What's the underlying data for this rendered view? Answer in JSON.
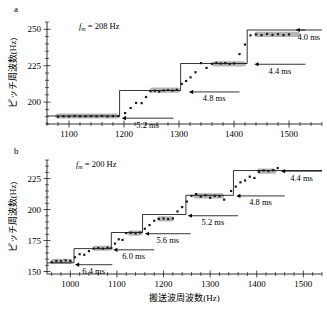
{
  "figure": {
    "panels": [
      {
        "id": "a",
        "label": "a",
        "annotation_text": "= 208 Hz",
        "annotation_symbol": "f",
        "annotation_sub": "m",
        "ylabel": "ピッチ周波数(Hz)",
        "xlabel": "",
        "ytick_labels": [
          "200",
          "225",
          "250"
        ],
        "xtick_labels": [
          "1100",
          "1200",
          "1300",
          "1400",
          "1500"
        ],
        "arrow_labels": [
          "5.2 ms",
          "4.8 ms",
          "4.4 ms",
          "4.0 ms"
        ]
      },
      {
        "id": "b",
        "label": "b",
        "annotation_text": "= 200 Hz",
        "annotation_symbol": "f",
        "annotation_sub": "m",
        "ylabel": "ピッチ周波数(Hz)",
        "xlabel": "搬送波周波数(Hz)",
        "ytick_labels": [
          "150",
          "175",
          "200",
          "225"
        ],
        "xtick_labels": [
          "1000",
          "1100",
          "1200",
          "1300",
          "1400",
          "1500"
        ],
        "arrow_labels": [
          "6.4 ms",
          "6.0 ms",
          "5.6 ms",
          "5.2 ms",
          "4.8 ms",
          "4.4 ms"
        ]
      }
    ]
  },
  "chart_data": [
    {
      "type": "scatter",
      "panel": "a",
      "title": "",
      "xlabel": "",
      "ylabel": "ピッチ周波数(Hz)",
      "xlim": [
        1060,
        1560
      ],
      "ylim": [
        185,
        255
      ],
      "xticks": [
        1100,
        1200,
        1300,
        1400,
        1500
      ],
      "yticks": [
        200,
        225,
        250
      ],
      "grid": false,
      "annotation": "f_m = 208 Hz",
      "step_function": {
        "name": "theoretical pitch (1/period quantization)",
        "x": [
          1060,
          1192,
          1192,
          1303,
          1303,
          1424,
          1424,
          1530
        ],
        "y": [
          190.5,
          190.5,
          208.0,
          208.0,
          226.5,
          226.5,
          249.5,
          249.5
        ]
      },
      "plateau_bands": [
        {
          "x_start": 1075,
          "x_end": 1190,
          "y": 190.5
        },
        {
          "x_start": 1247,
          "x_end": 1302,
          "y": 208.2
        },
        {
          "x_start": 1360,
          "x_end": 1422,
          "y": 226.3
        },
        {
          "x_start": 1437,
          "x_end": 1520,
          "y": 246.5
        }
      ],
      "series": [
        {
          "name": "measured pitch",
          "x": [
            1080,
            1090,
            1100,
            1110,
            1120,
            1130,
            1140,
            1150,
            1160,
            1170,
            1180,
            1190,
            1202,
            1212,
            1222,
            1232,
            1240,
            1248,
            1256,
            1264,
            1272,
            1280,
            1288,
            1296,
            1305,
            1313,
            1321,
            1330,
            1340,
            1350,
            1360,
            1368,
            1376,
            1384,
            1392,
            1400,
            1410,
            1420,
            1430,
            1440,
            1450,
            1460,
            1470,
            1480,
            1490,
            1500
          ],
          "y": [
            190.0,
            190.3,
            190.2,
            190.5,
            190.2,
            190.3,
            190.4,
            190.3,
            190.5,
            190.2,
            190.4,
            190.3,
            192.5,
            196.0,
            199.5,
            199.3,
            203.5,
            207.5,
            207.8,
            207.2,
            208.0,
            208.3,
            208.0,
            208.5,
            212.5,
            214.5,
            217.0,
            220.5,
            226.8,
            223.5,
            226.3,
            227.0,
            226.5,
            226.8,
            226.2,
            226.6,
            233.0,
            239.5,
            245.8,
            246.5,
            246.0,
            246.8,
            246.2,
            246.6,
            246.0,
            246.5
          ]
        }
      ],
      "annotations": [
        {
          "text": "5.2 ms",
          "x_arrow_start": 1290,
          "x_arrow_end": 1196,
          "y": 189.0
        },
        {
          "text": "4.8 ms",
          "x_arrow_start": 1410,
          "x_arrow_end": 1318,
          "y": 207.0
        },
        {
          "text": "4.4 ms",
          "x_arrow_start": 1530,
          "x_arrow_end": 1437,
          "y": 226.0
        },
        {
          "text": "4.0 ms",
          "x_arrow_start": 1560,
          "x_arrow_end": 1512,
          "y": 249.5
        }
      ]
    },
    {
      "type": "scatter",
      "panel": "b",
      "title": "",
      "xlabel": "搬送波周波数(Hz)",
      "ylabel": "ピッチ周波数(Hz)",
      "xlim": [
        950,
        1540
      ],
      "ylim": [
        148,
        240
      ],
      "xticks": [
        1000,
        1100,
        1200,
        1300,
        1400,
        1500
      ],
      "yticks": [
        150,
        175,
        200,
        225
      ],
      "grid": false,
      "annotation": "f_m = 200 Hz",
      "step_function": {
        "name": "theoretical pitch (1/period quantization)",
        "x": [
          950,
          1008,
          1008,
          1088,
          1088,
          1155,
          1155,
          1248,
          1248,
          1350,
          1350,
          1540
        ],
        "y": [
          157.0,
          157.0,
          168.5,
          168.5,
          181.5,
          181.5,
          196.0,
          196.0,
          211.5,
          211.5,
          231.5,
          231.5
        ]
      },
      "plateau_bands": [
        {
          "x_start": 958,
          "x_end": 1005,
          "y": 158.2
        },
        {
          "x_start": 1048,
          "x_end": 1088,
          "y": 168.8
        },
        {
          "x_start": 1123,
          "x_end": 1155,
          "y": 181.0
        },
        {
          "x_start": 1186,
          "x_end": 1222,
          "y": 192.5
        },
        {
          "x_start": 1264,
          "x_end": 1330,
          "y": 211.0
        },
        {
          "x_start": 1400,
          "x_end": 1442,
          "y": 231.0
        }
      ],
      "series": [
        {
          "name": "measured pitch",
          "x": [
            960,
            970,
            980,
            990,
            1000,
            1010,
            1020,
            1030,
            1040,
            1050,
            1060,
            1070,
            1080,
            1088,
            1096,
            1104,
            1112,
            1120,
            1130,
            1140,
            1150,
            1160,
            1170,
            1180,
            1190,
            1200,
            1210,
            1220,
            1230,
            1240,
            1250,
            1260,
            1270,
            1280,
            1290,
            1300,
            1310,
            1320,
            1330,
            1345,
            1355,
            1365,
            1375,
            1385,
            1395,
            1405,
            1415,
            1425,
            1435,
            1445
          ],
          "y": [
            157.5,
            158.5,
            158.3,
            159.0,
            158.5,
            161.5,
            164.0,
            163.5,
            166.5,
            168.5,
            169.0,
            168.5,
            169.3,
            168.8,
            172.5,
            176.0,
            175.5,
            181.0,
            181.3,
            180.8,
            181.5,
            184.5,
            187.5,
            191.0,
            192.5,
            192.8,
            192.3,
            192.8,
            198.5,
            202.0,
            206.5,
            211.0,
            212.5,
            210.5,
            211.5,
            209.5,
            211.0,
            210.8,
            208.0,
            215.0,
            218.5,
            222.0,
            223.5,
            226.5,
            225.5,
            230.5,
            231.5,
            231.0,
            231.8,
            233.5
          ]
        }
      ],
      "annotations": [
        {
          "text": "6.4 ms",
          "x_arrow_start": 1090,
          "x_arrow_end": 1010,
          "y": 155.5
        },
        {
          "text": "6.0 ms",
          "x_arrow_start": 1180,
          "x_arrow_end": 1092,
          "y": 167.5
        },
        {
          "text": "5.6 ms",
          "x_arrow_start": 1258,
          "x_arrow_end": 1160,
          "y": 180.5
        },
        {
          "text": "5.2 ms",
          "x_arrow_start": 1360,
          "x_arrow_end": 1252,
          "y": 195.0
        },
        {
          "text": "4.8 ms",
          "x_arrow_start": 1460,
          "x_arrow_end": 1356,
          "y": 211.0
        },
        {
          "text": "4.4 ms",
          "x_arrow_start": 1540,
          "x_arrow_end": 1452,
          "y": 231.0
        }
      ]
    }
  ]
}
